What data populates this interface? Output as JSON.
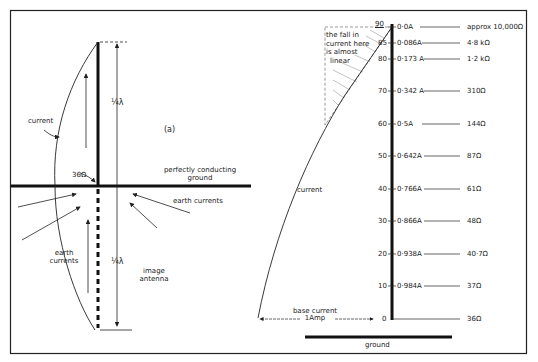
{
  "left_diagram": {
    "label": "(a)",
    "current_label": "current",
    "resistance_label": "36Ω",
    "upper_height_label": "¼λ",
    "lower_height_label": "¼λ",
    "ground_label_line1": "perfectly conducting",
    "ground_label_line2": "ground",
    "earth_currents_right": "earth currents",
    "earth_currents_left_line1": "earth",
    "earth_currents_left_line2": "currents",
    "image_antenna_line1": "image",
    "image_antenna_line2": "antenna"
  },
  "right_diagram": {
    "note_line1": "the fall in",
    "note_line2": "current here",
    "note_line3": "is almost",
    "note_line4": "linear",
    "current_label": "current",
    "base_current_line1": "base current",
    "base_current_line2": "1Amp",
    "ground_label": "ground",
    "rows": [
      {
        "deg": "90",
        "current": "0·0A",
        "impedance": "approx 10,000Ω"
      },
      {
        "deg": "85",
        "current": "0·086A",
        "impedance": "4·8 kΩ"
      },
      {
        "deg": "80",
        "current": "0·173 A",
        "impedance": "1·2 kΩ"
      },
      {
        "deg": "70",
        "current": "0·342 A",
        "impedance": "310Ω"
      },
      {
        "deg": "60",
        "current": "0·5A",
        "impedance": "144Ω"
      },
      {
        "deg": "50",
        "current": "0·642A",
        "impedance": "87Ω"
      },
      {
        "deg": "40",
        "current": "0·766A",
        "impedance": "61Ω"
      },
      {
        "deg": "30",
        "current": "0·866A",
        "impedance": "48Ω"
      },
      {
        "deg": "20",
        "current": "0·938A",
        "impedance": "40·7Ω"
      },
      {
        "deg": "10",
        "current": "0·984A",
        "impedance": "37Ω"
      },
      {
        "deg": "0",
        "current": "",
        "impedance": "36Ω"
      }
    ]
  }
}
